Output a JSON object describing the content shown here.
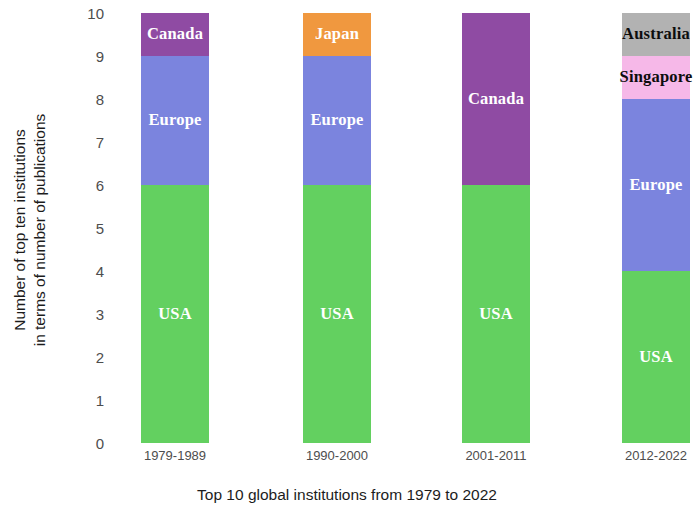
{
  "chart_data": {
    "type": "bar",
    "subtype": "stacked-bar",
    "title": "",
    "xlabel": "Top 10 global institutions from 1979 to 2022",
    "ylabel_line1": "Number of top ten institutions",
    "ylabel_line2": "in terms of number of publications",
    "categories": [
      "1979-1989",
      "1990-2000",
      "2001-2011",
      "2012-2022"
    ],
    "ylim": [
      0,
      10
    ],
    "yticks": [
      10,
      9,
      8,
      7,
      6,
      5,
      4,
      3,
      2,
      1,
      0
    ],
    "grid": false,
    "legend": "none (in-bar labels)",
    "series": [
      {
        "name": "USA",
        "color": "#63d060",
        "values": [
          6,
          6,
          6,
          4
        ]
      },
      {
        "name": "Europe",
        "color": "#7b84de",
        "values": [
          3,
          3,
          0,
          4
        ]
      },
      {
        "name": "Canada",
        "color": "#8f4ba3",
        "values": [
          1,
          0,
          4,
          0
        ]
      },
      {
        "name": "Japan",
        "color": "#f0983f",
        "values": [
          0,
          1,
          0,
          0
        ]
      },
      {
        "name": "Singapore",
        "color": "#f6b8e8",
        "values": [
          0,
          0,
          0,
          1
        ]
      },
      {
        "name": "Australia",
        "color": "#b2b2b2",
        "values": [
          0,
          0,
          0,
          1
        ]
      }
    ],
    "bars": [
      {
        "category": "1979-1989",
        "segments": [
          {
            "label": "USA",
            "value": 6,
            "start": 0,
            "end": 6,
            "color": "#63d060",
            "text_color": "#ffffff"
          },
          {
            "label": "Europe",
            "value": 3,
            "start": 6,
            "end": 9,
            "color": "#7b84de",
            "text_color": "#ffffff"
          },
          {
            "label": "Canada",
            "value": 1,
            "start": 9,
            "end": 10,
            "color": "#8f4ba3",
            "text_color": "#ffffff"
          }
        ]
      },
      {
        "category": "1990-2000",
        "segments": [
          {
            "label": "USA",
            "value": 6,
            "start": 0,
            "end": 6,
            "color": "#63d060",
            "text_color": "#ffffff"
          },
          {
            "label": "Europe",
            "value": 3,
            "start": 6,
            "end": 9,
            "color": "#7b84de",
            "text_color": "#ffffff"
          },
          {
            "label": "Japan",
            "value": 1,
            "start": 9,
            "end": 10,
            "color": "#f0983f",
            "text_color": "#ffffff"
          }
        ]
      },
      {
        "category": "2001-2011",
        "segments": [
          {
            "label": "USA",
            "value": 6,
            "start": 0,
            "end": 6,
            "color": "#63d060",
            "text_color": "#ffffff"
          },
          {
            "label": "Canada",
            "value": 4,
            "start": 6,
            "end": 10,
            "color": "#8f4ba3",
            "text_color": "#ffffff"
          }
        ]
      },
      {
        "category": "2012-2022",
        "segments": [
          {
            "label": "USA",
            "value": 4,
            "start": 0,
            "end": 4,
            "color": "#63d060",
            "text_color": "#ffffff"
          },
          {
            "label": "Europe",
            "value": 4,
            "start": 4,
            "end": 8,
            "color": "#7b84de",
            "text_color": "#ffffff"
          },
          {
            "label": "Singapore",
            "value": 1,
            "start": 8,
            "end": 9,
            "color": "#f6b8e8",
            "text_color": "#0d0d0d"
          },
          {
            "label": "Australia",
            "value": 1,
            "start": 9,
            "end": 10,
            "color": "#b2b2b2",
            "text_color": "#0d0d0d"
          }
        ]
      }
    ]
  }
}
